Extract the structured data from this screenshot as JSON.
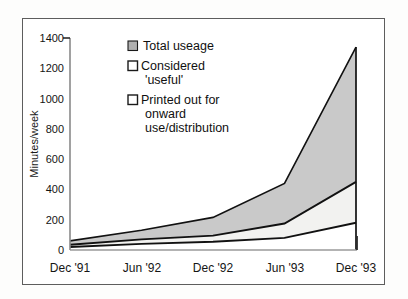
{
  "figure": {
    "background_color": "#ffffff",
    "frame_color": "#5d5d5d"
  },
  "chart_data": {
    "type": "area",
    "title": "",
    "subtitle": "",
    "xlabel": "",
    "ylabel": "Minutes/week",
    "categories": [
      "Dec '91",
      "Jun '92",
      "Dec '92",
      "Jun '93",
      "Dec '93"
    ],
    "x_tick_labels": [
      "Dec '91",
      "Jun '92",
      "Dec '92",
      "Jun '93",
      "Dec '93"
    ],
    "y_tick_labels": [
      "0",
      "200",
      "400",
      "600",
      "800",
      "1000",
      "1200",
      "1400"
    ],
    "y_ticks": [
      0,
      200,
      400,
      600,
      800,
      1000,
      1200,
      1400
    ],
    "ylim": [
      0,
      1400
    ],
    "grid": false,
    "legend_position": "upper-left-inside",
    "stacked": false,
    "series": [
      {
        "name": "Total useage",
        "legend_label": "Total useage",
        "swatch_fill": "#b0b0b0",
        "swatch_border": "#1a1a1a",
        "values": [
          60,
          130,
          215,
          440,
          1340
        ]
      },
      {
        "name": "Considered 'useful'",
        "legend_label_line1": "Considered",
        "legend_label_line2": "'useful'",
        "legend_label": "Considered 'useful'",
        "swatch_fill": "#ffffff",
        "swatch_border": "#1a1a1a",
        "values": [
          35,
          70,
          95,
          175,
          450
        ]
      },
      {
        "name": "Printed out for onward use/distribution",
        "legend_label_line1": "Printed out for",
        "legend_label_line2": "onward",
        "legend_label_line3": "use/distribution",
        "legend_label": "Printed out for onward use/distribution",
        "swatch_fill": "#ffffff",
        "swatch_border": "#1a1a1a",
        "values": [
          20,
          40,
          55,
          80,
          180
        ]
      }
    ],
    "band_fills": {
      "total_band": "#c9c9c9",
      "useful_band": "#f2f2f0",
      "printed_band": "#ffffff"
    }
  }
}
